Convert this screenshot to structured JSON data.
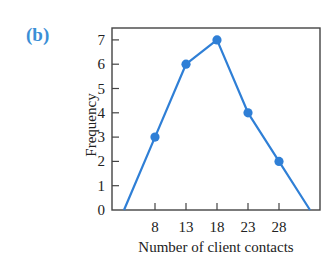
{
  "panel_label": "(b)",
  "colors": {
    "series": "#2f7fd6",
    "axis": "#444444",
    "panel_label": "#3a8fd6"
  },
  "chart_data": {
    "type": "line",
    "title": "",
    "panel": "(b)",
    "xlabel": "Number of client contacts",
    "ylabel": "Frequency",
    "x_ticks": [
      8,
      13,
      18,
      23,
      28
    ],
    "y_ticks": [
      0,
      1,
      2,
      3,
      4,
      5,
      6,
      7
    ],
    "xlim": [
      0,
      35
    ],
    "ylim": [
      0,
      7.5
    ],
    "grid": false,
    "legend": null,
    "series": [
      {
        "name": "Frequency polygon",
        "x": [
          3,
          8,
          13,
          18,
          23,
          28,
          33
        ],
        "y": [
          0,
          3,
          6,
          7,
          4,
          2,
          0
        ],
        "markers_at": [
          8,
          13,
          18,
          23,
          28
        ]
      }
    ]
  }
}
